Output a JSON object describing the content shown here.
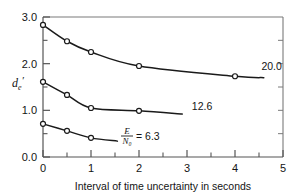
{
  "chart_data": {
    "type": "line",
    "title": "",
    "xlabel": "Interval of time uncertainty in seconds",
    "ylabel": "d_e'",
    "ylabel_parts": {
      "base": "d",
      "sub": "e",
      "prime": "′"
    },
    "xlim": [
      0,
      5
    ],
    "ylim": [
      0,
      3
    ],
    "xticks": [
      0,
      1,
      2,
      3,
      4,
      5
    ],
    "xtick_labels": [
      "0",
      "1",
      "2",
      "3",
      "4",
      "5"
    ],
    "x_minor_ticks": [
      0.5,
      1.5,
      2.5,
      3.5,
      4.5
    ],
    "yticks": [
      0,
      1,
      2,
      3
    ],
    "ytick_labels": [
      "0.0",
      "1.0",
      "2.0",
      "3.0"
    ],
    "y_minor_ticks": [
      0.5,
      1.5,
      2.5
    ],
    "grid": false,
    "legend_position": "inline-end-of-curve",
    "annotations": [
      {
        "text": "E/N₀ = 6.3",
        "numerator": "E",
        "denominator": "N₀",
        "equals_value": "6.3",
        "x": 1.75,
        "y": 0.45
      }
    ],
    "series": [
      {
        "name": "20.0",
        "label": "20.0",
        "label_x": 4.55,
        "label_y": 1.86,
        "x": [
          0,
          0.5,
          1,
          2,
          4
        ],
        "y": [
          2.83,
          2.48,
          2.25,
          1.95,
          1.73
        ],
        "curve_end_x": 4.6,
        "curve_end_y": 1.7,
        "marker": "open-circle"
      },
      {
        "name": "12.6",
        "label": "12.6",
        "label_x": 3.1,
        "label_y": 1.0,
        "x": [
          0,
          0.5,
          1,
          2
        ],
        "y": [
          1.61,
          1.33,
          1.05,
          0.99
        ],
        "curve_end_x": 2.9,
        "curve_end_y": 0.92,
        "marker": "open-circle"
      },
      {
        "name": "6.3",
        "label": "",
        "label_x": 1.8,
        "label_y": 0.45,
        "x": [
          0,
          0.5,
          1
        ],
        "y": [
          0.71,
          0.56,
          0.41
        ],
        "curve_end_x": 1.55,
        "curve_end_y": 0.34,
        "marker": "open-circle"
      }
    ],
    "colors": {
      "curve": "#1a1a1a",
      "axis": "#555555",
      "frame": "#7a7a7a",
      "marker_fill": "#ffffff",
      "background": "#ffffff"
    }
  }
}
